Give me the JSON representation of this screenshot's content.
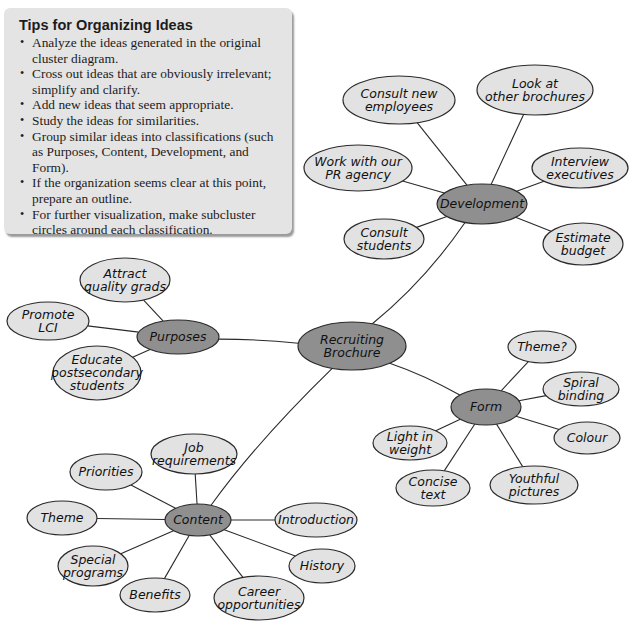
{
  "tips": {
    "title": "Tips for Organizing Ideas",
    "items": [
      "Analyze the ideas generated in the original cluster diagram.",
      "Cross out ideas that are obviously irrelevant; simplify and clarify.",
      "Add new ideas that seem appropriate.",
      "Study the ideas for similarities.",
      "Group similar ideas into classifications (such as Purposes, Content, Development, and Form).",
      "If the organization seems clear at this point, prepare an outline.",
      "For further visualization, make subcluster circles around each classification."
    ]
  },
  "colors": {
    "tips_background": "#e4e4e4",
    "hub_fill": "#8f8f8f",
    "leaf_fill": "#e2e2e2",
    "stroke": "#2a2a2a"
  },
  "diagram": {
    "center": {
      "id": "center",
      "lines": [
        "Recruiting",
        "Brochure"
      ],
      "cx": 352,
      "cy": 346,
      "rx": 54,
      "ry": 24
    },
    "hubs": [
      {
        "id": "development",
        "lines": [
          "Development"
        ],
        "cx": 482,
        "cy": 204,
        "rx": 45,
        "ry": 20,
        "leaves": [
          {
            "lines": [
              "Consult new",
              "employees"
            ],
            "cx": 399,
            "cy": 100,
            "rx": 56,
            "ry": 24
          },
          {
            "lines": [
              "Look at",
              "other brochures"
            ],
            "cx": 535,
            "cy": 90,
            "rx": 58,
            "ry": 25
          },
          {
            "lines": [
              "Work with our",
              "PR agency"
            ],
            "cx": 358,
            "cy": 168,
            "rx": 54,
            "ry": 23
          },
          {
            "lines": [
              "Interview",
              "executives"
            ],
            "cx": 580,
            "cy": 168,
            "rx": 48,
            "ry": 20
          },
          {
            "lines": [
              "Consult",
              "students"
            ],
            "cx": 384,
            "cy": 239,
            "rx": 40,
            "ry": 20
          },
          {
            "lines": [
              "Estimate",
              "budget"
            ],
            "cx": 583,
            "cy": 244,
            "rx": 40,
            "ry": 21
          }
        ]
      },
      {
        "id": "purposes",
        "lines": [
          "Purposes"
        ],
        "cx": 178,
        "cy": 337,
        "rx": 41,
        "ry": 17,
        "leaves": [
          {
            "lines": [
              "Attract",
              "quality grads"
            ],
            "cx": 125,
            "cy": 280,
            "rx": 45,
            "ry": 22
          },
          {
            "lines": [
              "Promote",
              "LCI"
            ],
            "cx": 48,
            "cy": 321,
            "rx": 41,
            "ry": 19
          },
          {
            "lines": [
              "Educate",
              "postsecondary",
              "students"
            ],
            "cx": 97,
            "cy": 373,
            "rx": 44,
            "ry": 27
          }
        ]
      },
      {
        "id": "form",
        "lines": [
          "Form"
        ],
        "cx": 486,
        "cy": 407,
        "rx": 35,
        "ry": 18,
        "leaves": [
          {
            "lines": [
              "Theme?"
            ],
            "cx": 542,
            "cy": 347,
            "rx": 34,
            "ry": 16
          },
          {
            "lines": [
              "Spiral",
              "binding"
            ],
            "cx": 581,
            "cy": 389,
            "rx": 38,
            "ry": 17
          },
          {
            "lines": [
              "Colour"
            ],
            "cx": 587,
            "cy": 438,
            "rx": 33,
            "ry": 16
          },
          {
            "lines": [
              "Light in",
              "weight"
            ],
            "cx": 410,
            "cy": 443,
            "rx": 37,
            "ry": 17
          },
          {
            "lines": [
              "Concise",
              "text"
            ],
            "cx": 433,
            "cy": 488,
            "rx": 37,
            "ry": 18
          },
          {
            "lines": [
              "Youthful",
              "pictures"
            ],
            "cx": 534,
            "cy": 485,
            "rx": 44,
            "ry": 19
          }
        ]
      },
      {
        "id": "content",
        "lines": [
          "Content"
        ],
        "cx": 198,
        "cy": 520,
        "rx": 33,
        "ry": 16,
        "leaves": [
          {
            "lines": [
              "Job",
              "requirements"
            ],
            "cx": 194,
            "cy": 454,
            "rx": 43,
            "ry": 20
          },
          {
            "lines": [
              "Priorities"
            ],
            "cx": 106,
            "cy": 472,
            "rx": 36,
            "ry": 18
          },
          {
            "lines": [
              "Theme"
            ],
            "cx": 62,
            "cy": 518,
            "rx": 35,
            "ry": 17
          },
          {
            "lines": [
              "Introduction"
            ],
            "cx": 316,
            "cy": 520,
            "rx": 41,
            "ry": 17
          },
          {
            "lines": [
              "Special",
              "programs"
            ],
            "cx": 93,
            "cy": 566,
            "rx": 35,
            "ry": 20
          },
          {
            "lines": [
              "History"
            ],
            "cx": 322,
            "cy": 566,
            "rx": 33,
            "ry": 17
          },
          {
            "lines": [
              "Benefits"
            ],
            "cx": 155,
            "cy": 595,
            "rx": 35,
            "ry": 17
          },
          {
            "lines": [
              "Career",
              "opportunities"
            ],
            "cx": 259,
            "cy": 598,
            "rx": 45,
            "ry": 22
          }
        ]
      }
    ]
  }
}
